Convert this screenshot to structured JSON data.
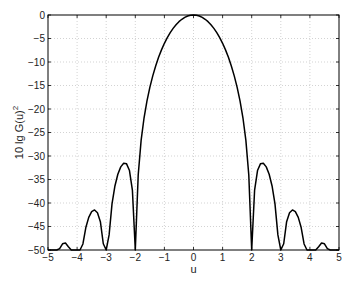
{
  "chart_data": {
    "type": "line",
    "title": "",
    "xlabel": "u",
    "ylabel": "10 lg G(u)",
    "ylabel_superscript": "2",
    "xlim": [
      -5,
      5
    ],
    "ylim": [
      -50,
      0
    ],
    "xticks": [
      -5,
      -4,
      -3,
      -2,
      -1,
      0,
      1,
      2,
      3,
      4,
      5
    ],
    "yticks": [
      0,
      -5,
      -10,
      -15,
      -20,
      -25,
      -30,
      -35,
      -40,
      -45,
      -50
    ],
    "grid": true,
    "grid_style": "dotted",
    "legend": null,
    "series": [
      {
        "name": "10 lg G(u)^2",
        "color": "#000000",
        "x": [
          -5.0,
          -4.9,
          -4.8,
          -4.7,
          -4.6,
          -4.5,
          -4.4,
          -4.3,
          -4.2,
          -4.1,
          -4.0,
          -3.9,
          -3.8,
          -3.7,
          -3.6,
          -3.5,
          -3.4,
          -3.3,
          -3.2,
          -3.1,
          -3.0,
          -2.9,
          -2.8,
          -2.7,
          -2.6,
          -2.5,
          -2.4,
          -2.3,
          -2.2,
          -2.1,
          -2.0,
          -1.9,
          -1.8,
          -1.7,
          -1.6,
          -1.5,
          -1.4,
          -1.3,
          -1.2,
          -1.1,
          -1.0,
          -0.9,
          -0.8,
          -0.7,
          -0.6,
          -0.5,
          -0.4,
          -0.3,
          -0.2,
          -0.1,
          0.0,
          0.1,
          0.2,
          0.3,
          0.4,
          0.5,
          0.6,
          0.7,
          0.8,
          0.9,
          1.0,
          1.1,
          1.2,
          1.3,
          1.4,
          1.5,
          1.6,
          1.7,
          1.8,
          1.9,
          2.0,
          2.1,
          2.2,
          2.3,
          2.4,
          2.5,
          2.6,
          2.7,
          2.8,
          2.9,
          3.0,
          3.1,
          3.2,
          3.3,
          3.4,
          3.5,
          3.6,
          3.7,
          3.8,
          3.9,
          4.0,
          4.1,
          4.2,
          4.3,
          4.4,
          4.5,
          4.6,
          4.7,
          4.8,
          4.9,
          5.0
        ],
        "y": [
          -50,
          -50,
          -50,
          -50,
          -49.72,
          -48.69,
          -48.52,
          -49.31,
          -50,
          -50,
          -50,
          -50,
          -48.72,
          -45.22,
          -43.06,
          -41.85,
          -41.48,
          -42.06,
          -43.97,
          -48.67,
          -50,
          -46.79,
          -40.2,
          -36.38,
          -33.89,
          -32.31,
          -31.54,
          -31.67,
          -33.09,
          -37.25,
          -50,
          -34.05,
          -26.67,
          -21.92,
          -18.32,
          -15.4,
          -12.95,
          -10.84,
          -9.01,
          -7.42,
          -6.02,
          -4.8,
          -3.75,
          -2.84,
          -2.07,
          -1.42,
          -0.91,
          -0.51,
          -0.22,
          -0.06,
          0,
          -0.06,
          -0.22,
          -0.51,
          -0.91,
          -1.42,
          -2.07,
          -2.84,
          -3.75,
          -4.8,
          -6.02,
          -7.42,
          -9.01,
          -10.84,
          -12.95,
          -15.4,
          -18.32,
          -21.92,
          -26.67,
          -34.05,
          -50,
          -37.25,
          -33.09,
          -31.67,
          -31.54,
          -32.31,
          -33.89,
          -36.38,
          -40.2,
          -46.79,
          -50,
          -48.67,
          -43.97,
          -42.06,
          -41.48,
          -41.85,
          -43.06,
          -45.22,
          -48.72,
          -50,
          -50,
          -50,
          -50,
          -49.31,
          -48.52,
          -48.69,
          -49.72,
          -50,
          -50,
          -50,
          -50
        ]
      }
    ],
    "annotations": []
  }
}
